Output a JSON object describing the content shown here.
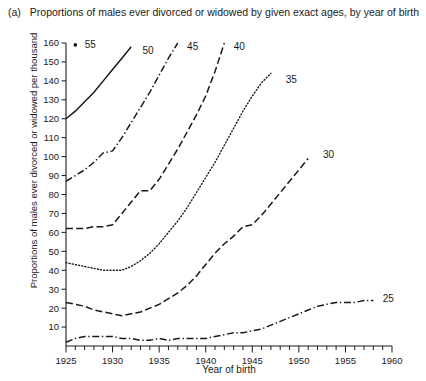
{
  "figure": {
    "panel_label": "(a)",
    "caption": "Proportions of males ever divorced or widowed by given exact ages, by year of birth"
  },
  "chart_data": {
    "type": "line",
    "title": "Proportions of males ever divorced or widowed by given exact ages, by year of birth",
    "xlabel": "Year of birth",
    "ylabel": "Proportions of males ever divorced or widowed per thousand",
    "xlim": [
      1925,
      1960
    ],
    "ylim": [
      0,
      160
    ],
    "xticks_major": [
      1925,
      1930,
      1935,
      1940,
      1945,
      1950,
      1955,
      1960
    ],
    "xticks_minor_step": 1,
    "yticks": [
      0,
      10,
      20,
      30,
      40,
      50,
      60,
      70,
      80,
      90,
      100,
      110,
      120,
      130,
      140,
      150,
      160
    ],
    "ytick_labels": [
      "",
      "10",
      "20",
      "30",
      "40",
      "50",
      "60",
      "70",
      "80",
      "90",
      "100",
      "110",
      "120",
      "130",
      "140",
      "150",
      "160"
    ],
    "grid": false,
    "legend_position": "inline-end-of-line",
    "series": [
      {
        "name": "55",
        "label": "55",
        "style": "marker-only",
        "color": "#1a1a1a",
        "x": [
          1926
        ],
        "y": [
          159
        ],
        "label_pos": {
          "x": 1927.0,
          "y": 159
        }
      },
      {
        "name": "50",
        "label": "50",
        "style": "solid",
        "color": "#1a1a1a",
        "x": [
          1925,
          1926,
          1927,
          1928,
          1929,
          1930,
          1931,
          1932
        ],
        "y": [
          120,
          124,
          129,
          134,
          140,
          146,
          152,
          158
        ],
        "label_pos": {
          "x": 1933.2,
          "y": 156
        }
      },
      {
        "name": "45",
        "label": "45",
        "style": "dashdot",
        "color": "#1a1a1a",
        "x": [
          1925,
          1926,
          1927,
          1928,
          1929,
          1930,
          1931,
          1932,
          1933,
          1934,
          1935,
          1936,
          1937
        ],
        "y": [
          87,
          90,
          93,
          97,
          102,
          103,
          110,
          118,
          126,
          134,
          143,
          152,
          160
        ],
        "label_pos": {
          "x": 1938.0,
          "y": 158
        }
      },
      {
        "name": "40",
        "label": "40",
        "style": "dashed",
        "color": "#1a1a1a",
        "x": [
          1925,
          1926,
          1927,
          1928,
          1929,
          1930,
          1931,
          1932,
          1933,
          1934,
          1935,
          1936,
          1937,
          1938,
          1939,
          1940,
          1941,
          1942
        ],
        "y": [
          62,
          62,
          62,
          63,
          63,
          64,
          70,
          76,
          82,
          82,
          88,
          96,
          104,
          113,
          122,
          132,
          145,
          160
        ],
        "label_pos": {
          "x": 1943.0,
          "y": 158
        }
      },
      {
        "name": "35",
        "label": "35",
        "style": "dotted",
        "color": "#1a1a1a",
        "x": [
          1925,
          1926,
          1927,
          1928,
          1929,
          1930,
          1931,
          1932,
          1933,
          1934,
          1935,
          1936,
          1937,
          1938,
          1939,
          1940,
          1941,
          1942,
          1943,
          1944,
          1945,
          1946,
          1947
        ],
        "y": [
          44,
          43,
          42,
          41,
          40,
          40,
          40,
          42,
          45,
          49,
          54,
          60,
          66,
          73,
          81,
          89,
          97,
          106,
          115,
          124,
          132,
          139,
          144
        ],
        "label_pos": {
          "x": 1948.6,
          "y": 141
        }
      },
      {
        "name": "30",
        "label": "30",
        "style": "dashed",
        "color": "#1a1a1a",
        "x": [
          1925,
          1926,
          1927,
          1928,
          1929,
          1930,
          1931,
          1932,
          1933,
          1934,
          1935,
          1936,
          1937,
          1938,
          1939,
          1940,
          1941,
          1942,
          1943,
          1944,
          1945,
          1946,
          1947,
          1948,
          1949,
          1950,
          1951
        ],
        "y": [
          23,
          22,
          21,
          19,
          18,
          17,
          16,
          17,
          18,
          20,
          22,
          25,
          28,
          32,
          37,
          43,
          49,
          54,
          58,
          63,
          64,
          69,
          75,
          81,
          87,
          93,
          99
        ],
        "label_pos": {
          "x": 1952.6,
          "y": 101
        }
      },
      {
        "name": "25",
        "label": "25",
        "style": "dashdot",
        "color": "#1a1a1a",
        "x": [
          1925,
          1926,
          1927,
          1928,
          1929,
          1930,
          1931,
          1932,
          1933,
          1934,
          1935,
          1936,
          1937,
          1938,
          1939,
          1940,
          1941,
          1942,
          1943,
          1944,
          1945,
          1946,
          1947,
          1948,
          1949,
          1950,
          1951,
          1952,
          1953,
          1954,
          1955,
          1956,
          1957,
          1958
        ],
        "y": [
          2,
          4,
          5,
          5,
          5,
          5,
          4,
          4,
          3,
          3,
          4,
          3,
          4,
          4,
          4,
          4,
          5,
          6,
          7,
          7,
          8,
          9,
          11,
          13,
          15,
          17,
          19,
          21,
          22,
          23,
          23,
          23,
          24,
          24
        ],
        "label_pos": {
          "x": 1959.0,
          "y": 25
        }
      }
    ]
  }
}
